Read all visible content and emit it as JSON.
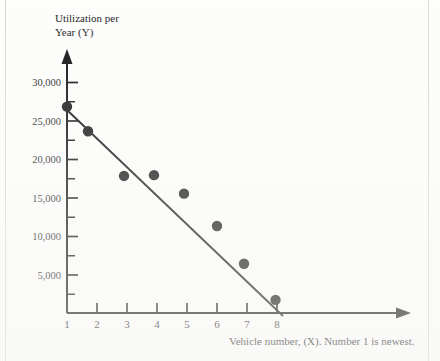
{
  "chart_data": {
    "type": "scatter",
    "title": "",
    "subtitle": "",
    "ylabel_lines": [
      "Utilization per",
      "Year (Y)"
    ],
    "ylabel": "Utilization per Year (Y)",
    "xlabel": "Vehicle number, (X).  Number 1 is newest.",
    "x": [
      1,
      1.7,
      2.9,
      3.9,
      4.9,
      6,
      6.9,
      7.95
    ],
    "values": [
      26800,
      23600,
      17800,
      17900,
      15500,
      11300,
      6400,
      1700
    ],
    "points": [
      {
        "x": 1,
        "y": 26800
      },
      {
        "x": 1.7,
        "y": 23600
      },
      {
        "x": 2.9,
        "y": 17800
      },
      {
        "x": 3.9,
        "y": 17900
      },
      {
        "x": 4.9,
        "y": 15500
      },
      {
        "x": 6,
        "y": 11300
      },
      {
        "x": 6.9,
        "y": 6400
      },
      {
        "x": 7.95,
        "y": 1700
      }
    ],
    "series": [
      {
        "name": "Vehicle utilization",
        "values": [
          26800,
          23600,
          17800,
          17900,
          15500,
          11300,
          6400,
          1700
        ]
      },
      {
        "name": "Trend line",
        "type": "line",
        "endpoints": [
          {
            "x": 1,
            "y": 26300
          },
          {
            "x": 8.2,
            "y": 0
          }
        ],
        "slope": -3653,
        "intercept": 29953
      }
    ],
    "xlim": [
      0.6,
      9.4
    ],
    "ylim": [
      0,
      31500
    ],
    "xticks": [
      1,
      2,
      3,
      4,
      5,
      6,
      7,
      8
    ],
    "xtick_labels": [
      "1",
      "2",
      "3",
      "4",
      "5",
      "6",
      "7",
      "8"
    ],
    "yticks": [
      5000,
      10000,
      15000,
      20000,
      25000,
      30000
    ],
    "ytick_labels": [
      "5,000",
      "10,000",
      "15,000",
      "20,000",
      "25,000",
      "30,000"
    ],
    "yticks_minor": [
      2500,
      7500,
      12500,
      17500,
      22500,
      27500
    ],
    "grid": false,
    "legend": "none",
    "axis_style": "arrow-ended",
    "colors": {
      "marker": "#151515",
      "line": "#111111",
      "axis": "#111111",
      "background": "#fdfdfc",
      "text": "#1c1c1c"
    }
  }
}
